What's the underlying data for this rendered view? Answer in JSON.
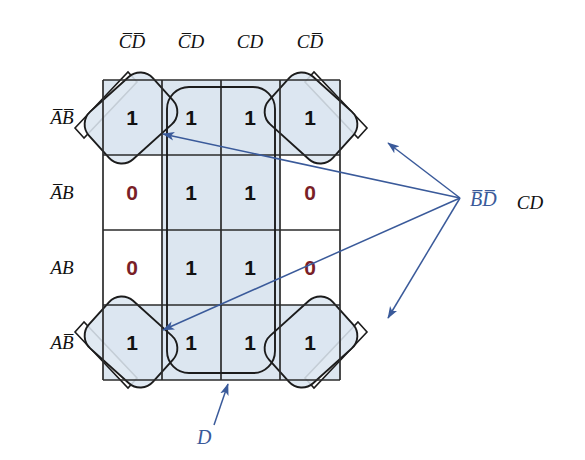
{
  "diagram": {
    "type": "karnaugh-map",
    "colors": {
      "grid_line": "#2b2b2b",
      "cell_fill_shaded": "#dce6f0",
      "cell_fill_plain": "#ffffff",
      "one_value": "#111111",
      "zero_value": "#7a1f28",
      "annotation": "#3a5a9a",
      "group_outline": "#1c1c1c",
      "background": "#ffffff"
    },
    "column_headers": [
      {
        "id": "col0",
        "text": "CD",
        "overbar": "both",
        "display": "C̅D̅"
      },
      {
        "id": "col1",
        "text": "CD",
        "overbar": "first",
        "display": "C̅D"
      },
      {
        "id": "col2",
        "text": "CD",
        "overbar": "none",
        "display": "CD"
      },
      {
        "id": "col3",
        "text": "CD",
        "overbar": "second",
        "display": "CD̅"
      }
    ],
    "row_headers": [
      {
        "id": "row0",
        "text": "AB",
        "overbar": "both",
        "display": "A̅B̅"
      },
      {
        "id": "row1",
        "text": "AB",
        "overbar": "first",
        "display": "A̅B"
      },
      {
        "id": "row2",
        "text": "AB",
        "overbar": "none",
        "display": "AB"
      },
      {
        "id": "row3",
        "text": "AB",
        "overbar": "second",
        "display": "AB̅"
      }
    ],
    "cells": [
      [
        {
          "value": "1",
          "shaded": true
        },
        {
          "value": "1",
          "shaded": true
        },
        {
          "value": "1",
          "shaded": true
        },
        {
          "value": "1",
          "shaded": true
        }
      ],
      [
        {
          "value": "0",
          "shaded": false
        },
        {
          "value": "1",
          "shaded": true
        },
        {
          "value": "1",
          "shaded": true
        },
        {
          "value": "0",
          "shaded": false
        }
      ],
      [
        {
          "value": "0",
          "shaded": false
        },
        {
          "value": "1",
          "shaded": true
        },
        {
          "value": "1",
          "shaded": true
        },
        {
          "value": "0",
          "shaded": false
        }
      ],
      [
        {
          "value": "1",
          "shaded": true
        },
        {
          "value": "1",
          "shaded": true
        },
        {
          "value": "1",
          "shaded": true
        },
        {
          "value": "1",
          "shaded": true
        }
      ]
    ],
    "groups": [
      {
        "id": "group-corner-tl",
        "label_ref": "bd-bar",
        "shape": "rotated-rounded-rect",
        "cell": [
          0,
          0
        ]
      },
      {
        "id": "group-corner-tr",
        "label_ref": "bd-bar",
        "shape": "rotated-rounded-rect",
        "cell": [
          0,
          3
        ]
      },
      {
        "id": "group-corner-bl",
        "label_ref": "bd-bar",
        "shape": "rotated-rounded-rect",
        "cell": [
          3,
          0
        ]
      },
      {
        "id": "group-corner-br",
        "label_ref": "bd-bar",
        "shape": "rotated-rounded-rect",
        "cell": [
          3,
          3
        ]
      },
      {
        "id": "group-middle-d",
        "label_ref": "d-label",
        "shape": "rounded-rect",
        "columns": [
          1,
          2
        ],
        "rows": [
          0,
          1,
          2,
          3
        ]
      }
    ],
    "annotations": [
      {
        "id": "bd-bar",
        "text": "BD",
        "overbar": "both",
        "display": "B̅D̅",
        "color": "#3a5a9a",
        "points_to": [
          "group-corner-tl",
          "group-corner-tr",
          "group-corner-bl",
          "group-corner-br"
        ]
      },
      {
        "id": "d-label",
        "text": "D",
        "overbar": "none",
        "display": "D",
        "color": "#3a5a9a",
        "points_to": [
          "group-middle-d"
        ]
      }
    ],
    "side_label": {
      "id": "cd-side-label",
      "text": "CD",
      "overbar": "none",
      "display": "CD",
      "color": "#111111"
    }
  }
}
